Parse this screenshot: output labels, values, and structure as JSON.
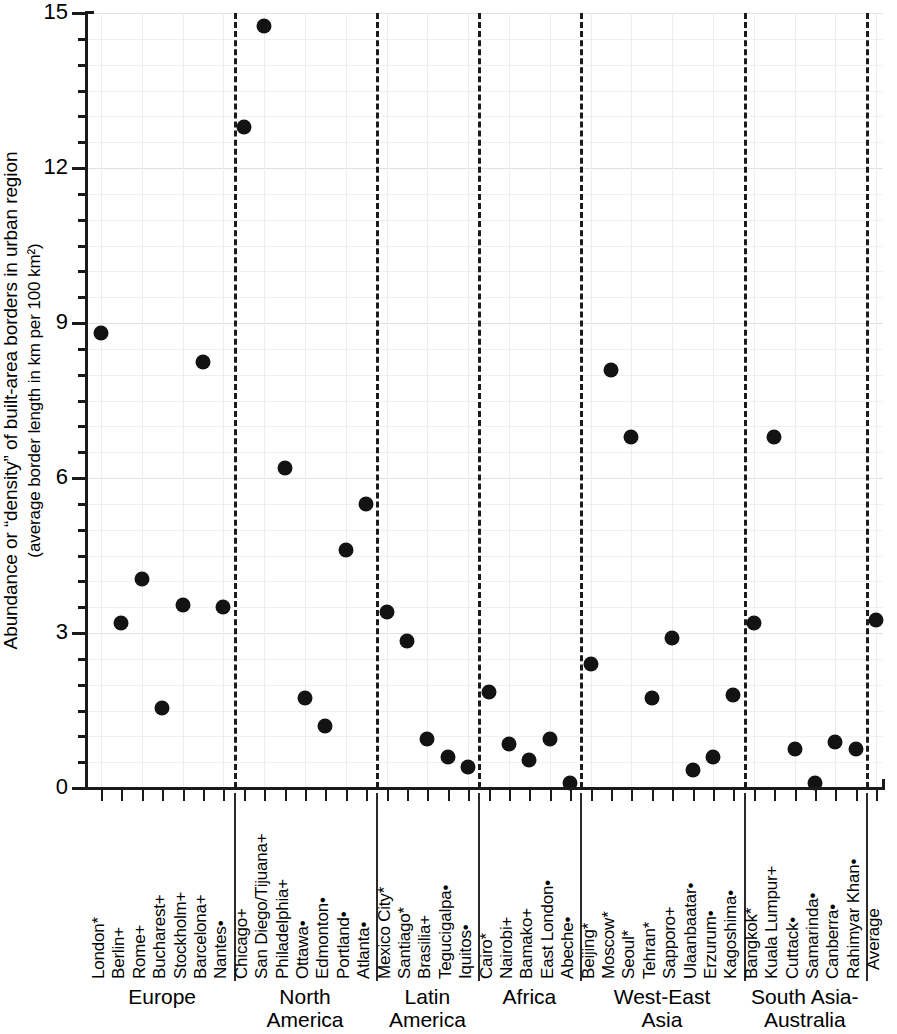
{
  "chart_data": {
    "type": "scatter",
    "title": "",
    "xlabel": "",
    "ylabel": "Abundance or \"density\" of built-area borders in urban region (average border length in km per 100 km2)",
    "ylabel_line1": "Abundance or “density” of built-area borders in urban region",
    "ylabel_line2": "(average border length in km per 100 km²)",
    "ylim": [
      0,
      15
    ],
    "yticks": [
      0,
      3,
      6,
      9,
      12,
      15
    ],
    "ytick_labels": [
      "0",
      "3",
      "6",
      "9",
      "12",
      "15"
    ],
    "minor_tick_step": 0.5,
    "grid": true,
    "legend": "none",
    "categories": [
      "London*",
      "Berlin+",
      "Rome+",
      "Bucharest+",
      "Stockholm+",
      "Barcelona+",
      "Nantes•",
      "Chicago+",
      "San Diego/Tijuana+",
      "Philadelphia+",
      "Ottawa•",
      "Edmonton•",
      "Portland•",
      "Atlanta•",
      "Mexico City*",
      "Santiago*",
      "Brasilia+",
      "Tegucigalpa•",
      "Iquitos•",
      "Cairo*",
      "Nairobi+",
      "Bamako+",
      "East London•",
      "Abeche•",
      "Beijing*",
      "Moscow*",
      "Seoul*",
      "Tehran*",
      "Sapporo+",
      "Ulaanbaatar•",
      "Erzurum•",
      "Kagoshima•",
      "Bangkok*",
      "Kuala Lumpur+",
      "Cuttack•",
      "Samarinda•",
      "Canberra•",
      "Rahimyar Khan•",
      "Average"
    ],
    "values": [
      8.8,
      3.2,
      4.05,
      1.55,
      3.55,
      8.25,
      3.5,
      12.8,
      14.75,
      6.2,
      1.75,
      1.2,
      4.6,
      5.5,
      3.4,
      2.85,
      0.95,
      0.6,
      0.4,
      1.85,
      0.85,
      0.55,
      0.95,
      0.1,
      2.4,
      8.1,
      6.8,
      1.75,
      2.9,
      0.35,
      0.6,
      1.8,
      3.2,
      6.8,
      0.75,
      0.1,
      0.9,
      0.75,
      3.25
    ],
    "groups": [
      {
        "name": "Europe",
        "name_line1": "Europe",
        "name_line2": "",
        "count": 7
      },
      {
        "name": "North America",
        "name_line1": "North",
        "name_line2": "America",
        "count": 7
      },
      {
        "name": "Latin America",
        "name_line1": "Latin",
        "name_line2": "America",
        "count": 5
      },
      {
        "name": "Africa",
        "name_line1": "Africa",
        "name_line2": "",
        "count": 5
      },
      {
        "name": "West-East Asia",
        "name_line1": "West-East",
        "name_line2": "Asia",
        "count": 8
      },
      {
        "name": "South Asia-Australia",
        "name_line1": "South Asia-",
        "name_line2": "Australia",
        "count": 6
      },
      {
        "name": "Average",
        "name_line1": "",
        "name_line2": "",
        "count": 1
      }
    ],
    "marker_color": "#131313",
    "axis_color": "#1a1a1a",
    "grid_color": "#eceaea"
  }
}
